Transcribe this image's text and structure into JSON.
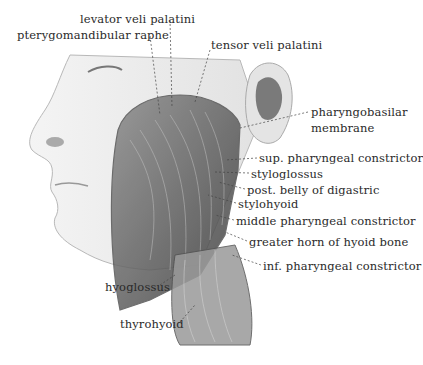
{
  "figure": {
    "labels": [
      {
        "id": "levator",
        "text": "levator veli palatini",
        "x": 80,
        "y": 13
      },
      {
        "id": "pterygo",
        "text": "pterygomandibular raphe",
        "x": 17,
        "y": 29
      },
      {
        "id": "tensor",
        "text": "tensor veli palatini",
        "x": 211,
        "y": 39
      },
      {
        "id": "pharyngobasilar1",
        "text": "pharyngobasilar",
        "x": 311,
        "y": 106
      },
      {
        "id": "pharyngobasilar2",
        "text": "membrane",
        "x": 311,
        "y": 122
      },
      {
        "id": "sup",
        "text": "sup. pharyngeal constrictor",
        "x": 259,
        "y": 152
      },
      {
        "id": "styloglossus",
        "text": "styloglossus",
        "x": 251,
        "y": 168
      },
      {
        "id": "postbelly",
        "text": "post. belly of digastric",
        "x": 247,
        "y": 184
      },
      {
        "id": "stylohyoid",
        "text": "stylohyoid",
        "x": 238,
        "y": 198
      },
      {
        "id": "middle",
        "text": "middle pharyngeal constrictor",
        "x": 236,
        "y": 215
      },
      {
        "id": "greater",
        "text": "greater horn of hyoid bone",
        "x": 249,
        "y": 236
      },
      {
        "id": "inf",
        "text": "inf. pharyngeal constrictor",
        "x": 263,
        "y": 260
      },
      {
        "id": "hyoglossus",
        "text": "hyoglossus",
        "x": 105,
        "y": 281
      },
      {
        "id": "thyrohyoid",
        "text": "thyrohyoid",
        "x": 120,
        "y": 318
      }
    ]
  }
}
